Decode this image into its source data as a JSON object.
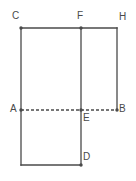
{
  "figure": {
    "background_color": "#ffffff",
    "stroke_color": "#4a4a4a",
    "dash_color": "#4a4a4a",
    "label_color": "#4a4a4a",
    "points": [
      {
        "id": "C",
        "label": "C",
        "x": 21,
        "y": 28,
        "label_x": 12,
        "label_y": 11,
        "dot": true
      },
      {
        "id": "F",
        "label": "F",
        "x": 81,
        "y": 28,
        "label_x": 77,
        "label_y": 11,
        "dot": true
      },
      {
        "id": "H",
        "label": "H",
        "x": 117,
        "y": 28,
        "label_x": 119,
        "label_y": 12,
        "dot": false
      },
      {
        "id": "A",
        "label": "A",
        "x": 21,
        "y": 110,
        "label_x": 10,
        "label_y": 104,
        "dot": true
      },
      {
        "id": "E",
        "label": "E",
        "x": 81,
        "y": 110,
        "label_x": 83,
        "label_y": 113,
        "dot": true
      },
      {
        "id": "B",
        "label": "B",
        "x": 117,
        "y": 110,
        "label_x": 119,
        "label_y": 104,
        "dot": true
      },
      {
        "id": "D",
        "label": "D",
        "x": 81,
        "y": 165,
        "label_x": 83,
        "label_y": 152,
        "dot": true
      }
    ],
    "solid_segments": [
      {
        "id": "CH",
        "from": "C",
        "to": "H",
        "x1": 21,
        "y1": 28,
        "x2": 117,
        "y2": 28
      },
      {
        "id": "C-bottom-left",
        "from": "C",
        "to": "bottom-left",
        "x1": 21,
        "y1": 28,
        "x2": 21,
        "y2": 165
      },
      {
        "id": "FD",
        "from": "F",
        "to": "D",
        "x1": 81,
        "y1": 28,
        "x2": 81,
        "y2": 165
      },
      {
        "id": "HB",
        "from": "H",
        "to": "B",
        "x1": 117,
        "y1": 28,
        "x2": 117,
        "y2": 110
      },
      {
        "id": "bottom-edge",
        "from": "bottom-left",
        "to": "D",
        "x1": 21,
        "y1": 165,
        "x2": 81,
        "y2": 165
      }
    ],
    "dashed_segments": [
      {
        "id": "AB",
        "from": "A",
        "to": "B",
        "x1": 21,
        "y1": 110,
        "x2": 117,
        "y2": 110,
        "dash_pattern": "3,2"
      }
    ]
  }
}
